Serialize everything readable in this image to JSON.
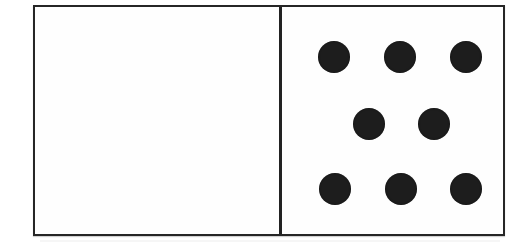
{
  "image": {
    "subject": "domino-tile",
    "width": 521,
    "height": 251,
    "background_color": "#ffffff",
    "alt_text": "Domino tile with a blank left half and eight pips on the right half"
  },
  "tile": {
    "border_color": "#262626",
    "face_color": "#fefefe",
    "divider_color": "#222222",
    "pip_color": "#1d1d1d",
    "pip_diameter": 32,
    "left_half": {
      "name": "blank",
      "pip_count": 0,
      "pips": []
    },
    "right_half": {
      "name": "eight",
      "pip_count": 8,
      "layout": "3-2-3",
      "pips": [
        {
          "id": "pip-top-left",
          "row": "top",
          "cx": 332,
          "cy": 55
        },
        {
          "id": "pip-top-center",
          "row": "top",
          "cx": 398,
          "cy": 55
        },
        {
          "id": "pip-top-right",
          "row": "top",
          "cx": 464,
          "cy": 55
        },
        {
          "id": "pip-middle-left",
          "row": "middle",
          "cx": 367,
          "cy": 122
        },
        {
          "id": "pip-middle-right",
          "row": "middle",
          "cx": 432,
          "cy": 122
        },
        {
          "id": "pip-bottom-left",
          "row": "bottom",
          "cx": 333,
          "cy": 187
        },
        {
          "id": "pip-bottom-center",
          "row": "bottom",
          "cx": 399,
          "cy": 187
        },
        {
          "id": "pip-bottom-right",
          "row": "bottom",
          "cx": 464,
          "cy": 187
        }
      ]
    },
    "value_label": "0-8"
  }
}
